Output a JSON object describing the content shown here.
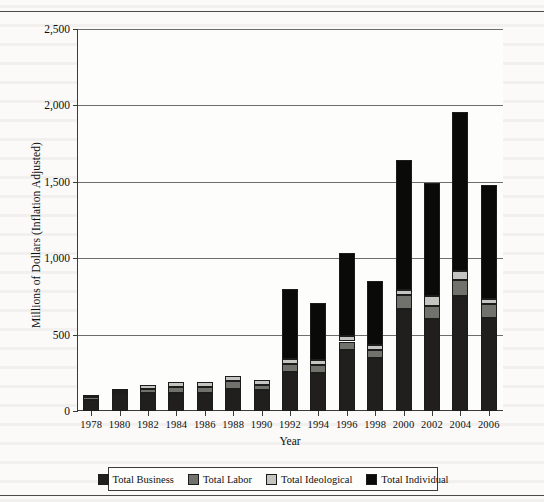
{
  "chart_data": {
    "type": "bar",
    "subtype": "stacked-vertical",
    "title": "",
    "xlabel": "Year",
    "ylabel": "Millions of Dollars (Inflation Adjusted)",
    "categories": [
      "1978",
      "1980",
      "1982",
      "1984",
      "1986",
      "1988",
      "1990",
      "1992",
      "1994",
      "1996",
      "1998",
      "2000",
      "2002",
      "2004",
      "2006"
    ],
    "ylim": [
      0,
      2500
    ],
    "yticks": [
      "0",
      "500",
      "1,000",
      "1,500",
      "2,000",
      "2,500"
    ],
    "ytick_values": [
      0,
      500,
      1000,
      1500,
      2000,
      2500
    ],
    "grid": "horizontal",
    "legend_position": "bottom",
    "series": [
      {
        "name": "Total Business",
        "color": "#211f1d",
        "values": [
          70,
          115,
          120,
          115,
          115,
          145,
          135,
          255,
          250,
          400,
          345,
          665,
          600,
          755,
          610
        ]
      },
      {
        "name": "Total Labor",
        "color": "#72726d",
        "values": [
          20,
          15,
          25,
          40,
          40,
          50,
          35,
          55,
          50,
          55,
          55,
          95,
          90,
          105,
          90
        ]
      },
      {
        "name": "Total Ideological",
        "color": "#c4c4c0",
        "values": [
          15,
          10,
          25,
          35,
          35,
          35,
          30,
          30,
          35,
          35,
          30,
          30,
          65,
          55,
          30
        ]
      },
      {
        "name": "Total Individual",
        "color": "#0a0a08",
        "values": [
          0,
          0,
          0,
          0,
          0,
          0,
          0,
          460,
          370,
          545,
          420,
          850,
          740,
          1040,
          750
        ]
      }
    ],
    "totals": [
      105,
      140,
      170,
      190,
      190,
      230,
      200,
      800,
      705,
      1035,
      850,
      1640,
      1495,
      1955,
      1480
    ]
  },
  "legend": {
    "items": [
      {
        "label": "Total Business",
        "swatch": "legend-swatch-business"
      },
      {
        "label": "Total Labor",
        "swatch": "legend-swatch-labor"
      },
      {
        "label": "Total Ideological",
        "swatch": "legend-swatch-ideological"
      },
      {
        "label": "Total Individual",
        "swatch": "legend-swatch-individual"
      }
    ]
  },
  "colors": {
    "business": "#211f1d",
    "labor": "#72726d",
    "ideological": "#c4c4c0",
    "individual": "#0a0a08",
    "axis": "#3b3b38",
    "grid": "#6e6e68",
    "page": "#fbfaf8"
  }
}
